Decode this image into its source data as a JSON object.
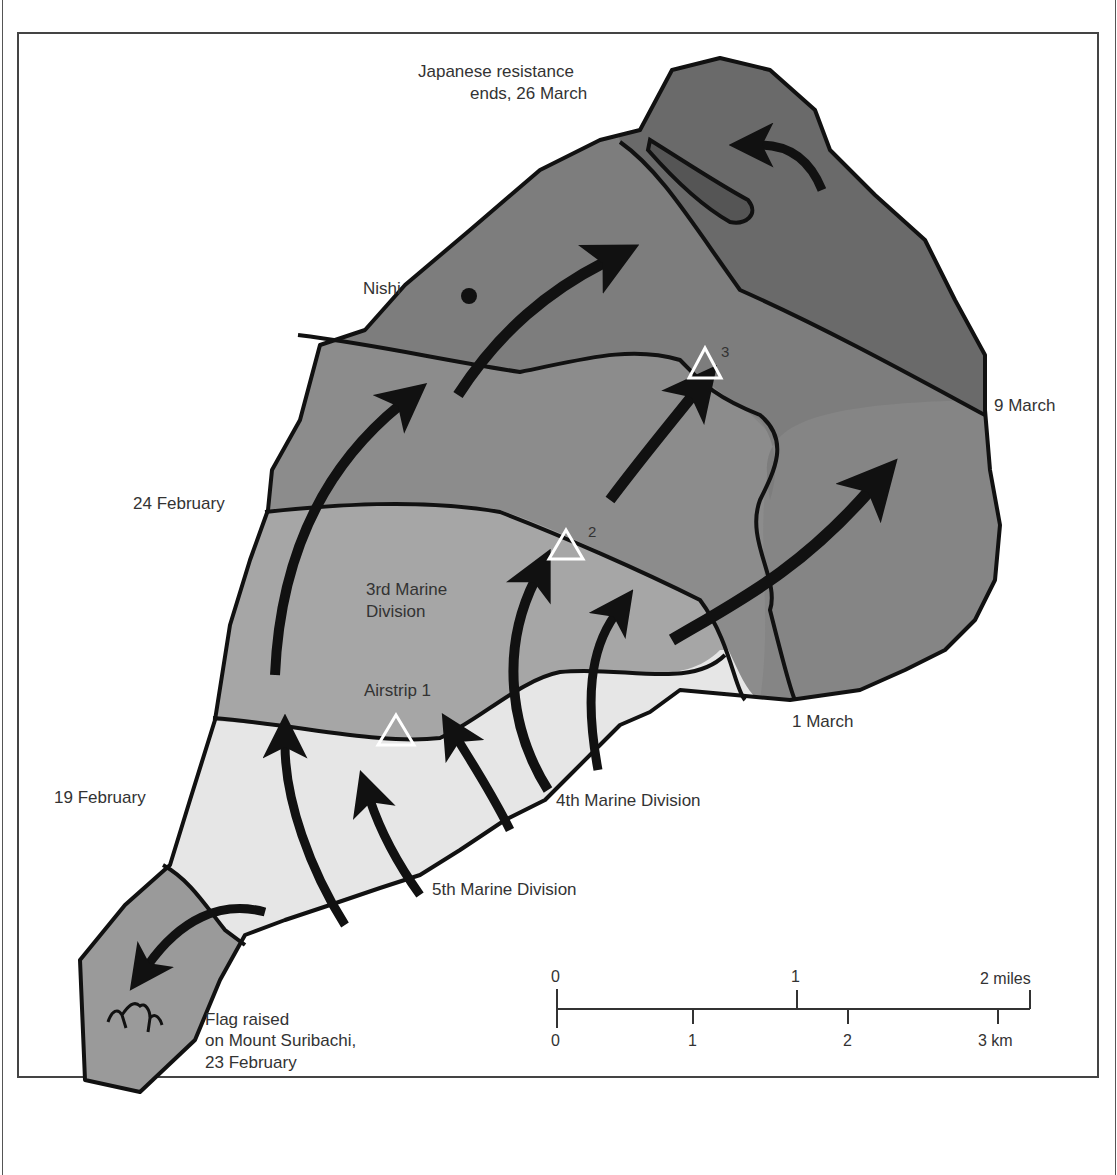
{
  "map": {
    "subject": "Battle of Iwo Jima advance",
    "colors": {
      "zone_19_feb": "#e6e6e6",
      "zone_24_feb": "#a6a6a6",
      "zone_1_mar": "#8c8c8c",
      "zone_9_mar": "#7d7d7d",
      "zone_26_mar": "#6a6a6a",
      "pocket": "#555555",
      "suribachi": "#9a9a9a",
      "outline": "#111111",
      "arrow": "#111111",
      "airstrip_marker": "#ffffff"
    },
    "phase_lines": [
      {
        "label": "19 February"
      },
      {
        "label": "24 February"
      },
      {
        "label": "1 March"
      },
      {
        "label": "9 March"
      }
    ],
    "labels": {
      "resistance_end_line1": "Japanese resistance",
      "resistance_end_line2": "ends, 26 March",
      "nishi": "Nishi",
      "third_div_line1": "3rd Marine",
      "third_div_line2": "Division",
      "airstrip1": "Airstrip 1",
      "airstrip2_num": "2",
      "airstrip3_num": "3",
      "fourth_div": "4th Marine Division",
      "fifth_div": "5th Marine Division",
      "flag_line1": "Flag raised",
      "flag_line2": "on Mount Suribachi,",
      "flag_line3": "23 February"
    },
    "scale_bar": {
      "miles_ticks": [
        "0",
        "1",
        "2 miles"
      ],
      "km_ticks": [
        "0",
        "1",
        "2",
        "3 km"
      ]
    }
  }
}
